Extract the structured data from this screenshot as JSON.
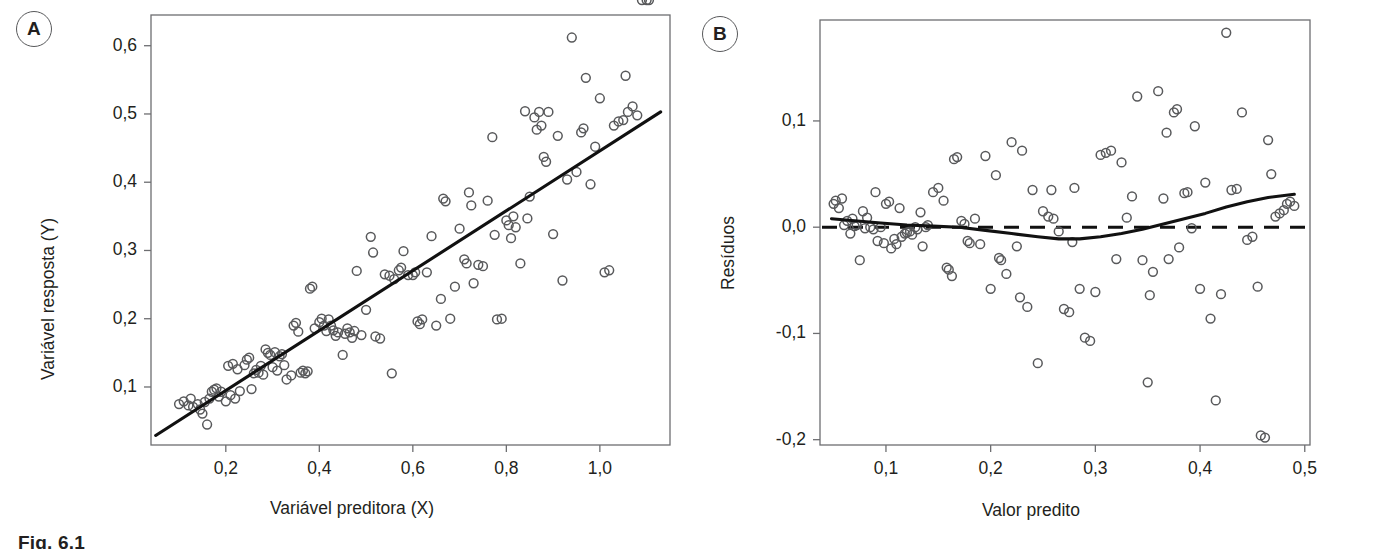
{
  "figure": {
    "caption_fragment": "Fig. 6.1",
    "panels": [
      {
        "badge": "A"
      },
      {
        "badge": "B"
      }
    ]
  },
  "chart_data": [
    {
      "type": "scatter",
      "panel": "A",
      "title": "",
      "xlabel": "Variável preditora (X)",
      "ylabel": "Variável resposta (Y)",
      "xticks": [
        "0,2",
        "0,4",
        "0,6",
        "0,8",
        "1,0"
      ],
      "xtick_values": [
        0.2,
        0.4,
        0.6,
        0.8,
        1.0
      ],
      "yticks": [
        "0,1",
        "0,2",
        "0,3",
        "0,4",
        "0,5",
        "0,6"
      ],
      "ytick_values": [
        0.1,
        0.2,
        0.3,
        0.4,
        0.5,
        0.6
      ],
      "xlim": [
        0.04,
        1.15
      ],
      "ylim": [
        0.015,
        0.645
      ],
      "grid": false,
      "legend": "none",
      "marker": "open-circle",
      "fit_line": {
        "style": "solid",
        "x": [
          0.05,
          1.13
        ],
        "y": [
          0.029,
          0.503
        ]
      },
      "x": [
        0.1,
        0.11,
        0.12,
        0.125,
        0.13,
        0.14,
        0.145,
        0.15,
        0.155,
        0.16,
        0.165,
        0.17,
        0.175,
        0.18,
        0.185,
        0.19,
        0.2,
        0.205,
        0.21,
        0.215,
        0.22,
        0.225,
        0.23,
        0.24,
        0.245,
        0.25,
        0.255,
        0.26,
        0.265,
        0.27,
        0.275,
        0.28,
        0.285,
        0.29,
        0.295,
        0.3,
        0.305,
        0.31,
        0.315,
        0.32,
        0.325,
        0.33,
        0.34,
        0.345,
        0.35,
        0.355,
        0.36,
        0.365,
        0.37,
        0.375,
        0.38,
        0.385,
        0.39,
        0.4,
        0.405,
        0.41,
        0.415,
        0.42,
        0.425,
        0.43,
        0.435,
        0.44,
        0.45,
        0.455,
        0.46,
        0.465,
        0.47,
        0.475,
        0.48,
        0.49,
        0.5,
        0.51,
        0.515,
        0.52,
        0.53,
        0.54,
        0.55,
        0.555,
        0.56,
        0.57,
        0.575,
        0.58,
        0.59,
        0.6,
        0.605,
        0.61,
        0.615,
        0.62,
        0.63,
        0.64,
        0.65,
        0.66,
        0.665,
        0.67,
        0.68,
        0.69,
        0.7,
        0.71,
        0.715,
        0.72,
        0.725,
        0.73,
        0.74,
        0.75,
        0.76,
        0.77,
        0.775,
        0.78,
        0.79,
        0.8,
        0.805,
        0.81,
        0.815,
        0.82,
        0.83,
        0.84,
        0.845,
        0.85,
        0.86,
        0.865,
        0.87,
        0.875,
        0.88,
        0.885,
        0.89,
        0.9,
        0.91,
        0.92,
        0.93,
        0.94,
        0.95,
        0.96,
        0.965,
        0.97,
        0.98,
        0.99,
        1.0,
        1.01,
        1.02,
        1.03,
        1.04,
        1.05,
        1.055,
        1.06,
        1.07,
        1.08,
        1.09,
        1.1,
        1.105
      ],
      "y": [
        0.075,
        0.079,
        0.073,
        0.083,
        0.071,
        0.075,
        0.067,
        0.061,
        0.078,
        0.045,
        0.083,
        0.093,
        0.096,
        0.098,
        0.086,
        0.093,
        0.079,
        0.131,
        0.088,
        0.134,
        0.083,
        0.126,
        0.094,
        0.132,
        0.14,
        0.143,
        0.097,
        0.12,
        0.125,
        0.121,
        0.131,
        0.118,
        0.155,
        0.15,
        0.147,
        0.129,
        0.151,
        0.124,
        0.145,
        0.148,
        0.132,
        0.111,
        0.117,
        0.19,
        0.194,
        0.181,
        0.121,
        0.124,
        0.12,
        0.123,
        0.244,
        0.247,
        0.186,
        0.195,
        0.2,
        0.19,
        0.182,
        0.199,
        0.19,
        0.183,
        0.175,
        0.18,
        0.147,
        0.178,
        0.186,
        0.18,
        0.172,
        0.182,
        0.27,
        0.176,
        0.213,
        0.32,
        0.297,
        0.174,
        0.171,
        0.265,
        0.263,
        0.12,
        0.258,
        0.271,
        0.275,
        0.299,
        0.264,
        0.264,
        0.268,
        0.196,
        0.192,
        0.199,
        0.268,
        0.321,
        0.19,
        0.229,
        0.376,
        0.372,
        0.2,
        0.247,
        0.332,
        0.287,
        0.281,
        0.385,
        0.366,
        0.252,
        0.279,
        0.277,
        0.373,
        0.466,
        0.323,
        0.199,
        0.2,
        0.344,
        0.337,
        0.318,
        0.35,
        0.334,
        0.281,
        0.504,
        0.347,
        0.379,
        0.495,
        0.477,
        0.503,
        0.483,
        0.437,
        0.43,
        0.503,
        0.324,
        0.468,
        0.256,
        0.404,
        0.612,
        0.415,
        0.473,
        0.479,
        0.553,
        0.397,
        0.452,
        0.523,
        0.268,
        0.271,
        0.483,
        0.489,
        0.491,
        0.556,
        0.503,
        0.511,
        0.498
      ]
    },
    {
      "type": "scatter",
      "panel": "B",
      "title": "",
      "xlabel": "Valor predito",
      "ylabel": "Resíduos",
      "xticks": [
        "0,1",
        "0,2",
        "0,3",
        "0,4",
        "0,5"
      ],
      "xtick_values": [
        0.1,
        0.2,
        0.3,
        0.4,
        0.5
      ],
      "yticks": [
        "0,1",
        "0,0",
        "-0,1",
        "-0,2"
      ],
      "ytick_values": [
        0.1,
        0.0,
        -0.1,
        -0.2
      ],
      "xlim": [
        0.037,
        0.505
      ],
      "ylim": [
        -0.205,
        0.195
      ],
      "grid": false,
      "legend": "none",
      "marker": "open-circle",
      "reference_line": {
        "style": "dashed",
        "y": 0.0
      },
      "smoother": {
        "style": "solid",
        "x": [
          0.048,
          0.07,
          0.095,
          0.12,
          0.145,
          0.17,
          0.195,
          0.22,
          0.245,
          0.265,
          0.285,
          0.305,
          0.325,
          0.345,
          0.365,
          0.385,
          0.405,
          0.425,
          0.445,
          0.465,
          0.49
        ],
        "y": [
          0.008,
          0.006,
          0.004,
          0.002,
          0.001,
          0.0,
          -0.003,
          -0.006,
          -0.009,
          -0.011,
          -0.011,
          -0.009,
          -0.006,
          -0.002,
          0.003,
          0.008,
          0.013,
          0.019,
          0.024,
          0.028,
          0.031
        ]
      },
      "x": [
        0.05,
        0.052,
        0.055,
        0.058,
        0.06,
        0.063,
        0.066,
        0.068,
        0.07,
        0.072,
        0.075,
        0.078,
        0.08,
        0.082,
        0.085,
        0.088,
        0.09,
        0.092,
        0.095,
        0.098,
        0.1,
        0.103,
        0.105,
        0.108,
        0.11,
        0.113,
        0.115,
        0.118,
        0.12,
        0.123,
        0.125,
        0.128,
        0.13,
        0.133,
        0.135,
        0.138,
        0.14,
        0.145,
        0.15,
        0.155,
        0.158,
        0.16,
        0.163,
        0.165,
        0.168,
        0.172,
        0.175,
        0.178,
        0.18,
        0.185,
        0.19,
        0.195,
        0.2,
        0.205,
        0.208,
        0.21,
        0.215,
        0.22,
        0.225,
        0.228,
        0.23,
        0.235,
        0.24,
        0.245,
        0.25,
        0.255,
        0.258,
        0.26,
        0.265,
        0.27,
        0.275,
        0.278,
        0.28,
        0.285,
        0.29,
        0.295,
        0.3,
        0.305,
        0.31,
        0.315,
        0.32,
        0.325,
        0.33,
        0.335,
        0.34,
        0.345,
        0.35,
        0.352,
        0.355,
        0.36,
        0.365,
        0.368,
        0.37,
        0.375,
        0.378,
        0.38,
        0.385,
        0.388,
        0.392,
        0.395,
        0.4,
        0.405,
        0.41,
        0.415,
        0.42,
        0.425,
        0.43,
        0.435,
        0.44,
        0.445,
        0.45,
        0.455,
        0.458,
        0.462,
        0.465,
        0.468,
        0.472,
        0.476,
        0.48,
        0.483,
        0.486,
        0.49
      ],
      "y": [
        0.022,
        0.025,
        0.018,
        0.027,
        0.002,
        0.006,
        -0.006,
        0.008,
        0.001,
        0.002,
        -0.031,
        0.015,
        -0.001,
        0.009,
        0.0,
        -0.002,
        0.033,
        -0.013,
        0.0,
        -0.015,
        0.022,
        0.024,
        -0.02,
        -0.011,
        -0.016,
        0.018,
        -0.009,
        -0.006,
        -0.005,
        -0.004,
        -0.007,
        0.0,
        -0.002,
        0.014,
        -0.018,
        0.0,
        0.002,
        0.033,
        0.037,
        0.025,
        -0.038,
        -0.04,
        -0.046,
        0.064,
        0.066,
        0.006,
        0.003,
        -0.013,
        -0.015,
        0.008,
        -0.016,
        0.067,
        -0.058,
        0.049,
        -0.029,
        -0.031,
        -0.044,
        0.08,
        -0.018,
        -0.066,
        0.072,
        -0.075,
        0.035,
        -0.128,
        0.015,
        0.01,
        0.035,
        0.008,
        -0.004,
        -0.077,
        -0.08,
        -0.014,
        0.037,
        -0.058,
        -0.104,
        -0.107,
        -0.061,
        0.068,
        0.07,
        0.072,
        -0.03,
        0.061,
        0.009,
        0.029,
        0.123,
        -0.031,
        -0.146,
        -0.064,
        -0.042,
        0.128,
        0.027,
        0.089,
        -0.03,
        0.108,
        0.111,
        -0.019,
        0.032,
        0.033,
        -0.001,
        0.095,
        -0.058,
        0.042,
        -0.086,
        -0.163,
        -0.063,
        0.183,
        0.035,
        0.036,
        0.108,
        -0.012,
        -0.009,
        -0.056,
        -0.196,
        -0.198,
        0.082,
        0.05,
        0.01,
        0.013,
        0.016,
        0.022,
        0.024,
        0.02
      ]
    }
  ]
}
